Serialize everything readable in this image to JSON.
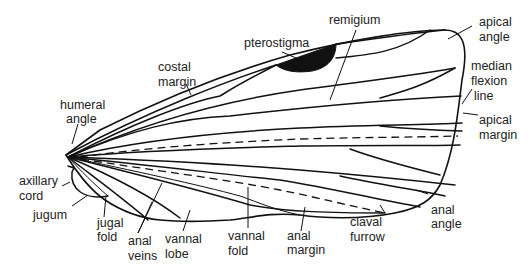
{
  "labels": {
    "pterostigma": [
      "pterostigma"
    ],
    "remigium": [
      "remigium"
    ],
    "apical_angle": [
      "apical",
      "angle"
    ],
    "costal_margin": [
      "costal",
      "margin"
    ],
    "median_flexion_line": [
      "median",
      "flexion",
      "line"
    ],
    "humeral_angle": [
      "humeral",
      "angle"
    ],
    "apical_margin": [
      "apical",
      "margin"
    ],
    "axillary_cord": [
      "axillary",
      "cord"
    ],
    "jugum": [
      "jugum"
    ],
    "jugal_fold": [
      "jugal",
      "fold"
    ],
    "anal_veins": [
      "anal",
      "veins"
    ],
    "vannal_lobe": [
      "vannal",
      "lobe"
    ],
    "vannal_fold": [
      "vannal",
      "fold"
    ],
    "anal_margin": [
      "anal",
      "margin"
    ],
    "claval_furrow": [
      "claval",
      "furrow"
    ],
    "anal_angle": [
      "anal",
      "angle"
    ]
  }
}
